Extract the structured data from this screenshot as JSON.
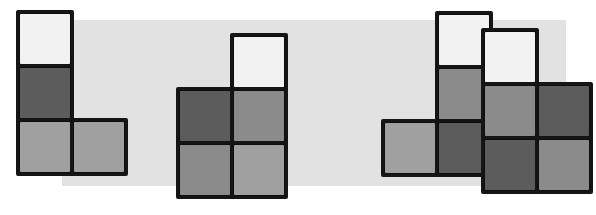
{
  "scene": {
    "width": 596,
    "height": 215,
    "background_color": "#ffffff",
    "title": "Four grayscale block shapes on a light gray band",
    "band": {
      "name": "background-band",
      "x": 62,
      "y": 20,
      "width": 504,
      "height": 166,
      "color": "#e2e2e2"
    },
    "palette": {
      "white": "#f2f2f2",
      "light_gray": "#a0a0a0",
      "mid_gray": "#8b8b8b",
      "dark_gray": "#5c5c5c",
      "outline": "#151515"
    },
    "cell_size": 54,
    "shapes": [
      {
        "name": "shape-1",
        "label": "J-tetromino",
        "origin_x": 16,
        "origin_y": 10,
        "cells": [
          {
            "name": "cell-r0c0",
            "col": 0,
            "row": 0,
            "color": "#f2f2f2",
            "shade": "white"
          },
          {
            "name": "cell-r1c0",
            "col": 0,
            "row": 1,
            "color": "#5c5c5c",
            "shade": "dark_gray"
          },
          {
            "name": "cell-r2c0",
            "col": 0,
            "row": 2,
            "color": "#a0a0a0",
            "shade": "light_gray"
          },
          {
            "name": "cell-r2c1",
            "col": 1,
            "row": 2,
            "color": "#a0a0a0",
            "shade": "light_gray"
          }
        ]
      },
      {
        "name": "shape-2",
        "label": "P-pentomino",
        "origin_x": 176,
        "origin_y": 33,
        "cells": [
          {
            "name": "cell-r0c1",
            "col": 1,
            "row": 0,
            "color": "#f2f2f2",
            "shade": "white"
          },
          {
            "name": "cell-r1c0",
            "col": 0,
            "row": 1,
            "color": "#5c5c5c",
            "shade": "dark_gray"
          },
          {
            "name": "cell-r1c1",
            "col": 1,
            "row": 1,
            "color": "#8b8b8b",
            "shade": "mid_gray"
          },
          {
            "name": "cell-r2c0",
            "col": 0,
            "row": 2,
            "color": "#8b8b8b",
            "shade": "mid_gray"
          },
          {
            "name": "cell-r2c1",
            "col": 1,
            "row": 2,
            "color": "#a0a0a0",
            "shade": "light_gray"
          }
        ]
      },
      {
        "name": "shape-3",
        "label": "L-tetromino",
        "origin_x": 381,
        "origin_y": 11,
        "cells": [
          {
            "name": "cell-r0c1",
            "col": 1,
            "row": 0,
            "color": "#f2f2f2",
            "shade": "white"
          },
          {
            "name": "cell-r1c1",
            "col": 1,
            "row": 1,
            "color": "#8b8b8b",
            "shade": "mid_gray"
          },
          {
            "name": "cell-r2c0",
            "col": 0,
            "row": 2,
            "color": "#a0a0a0",
            "shade": "light_gray"
          },
          {
            "name": "cell-r2c1",
            "col": 1,
            "row": 2,
            "color": "#5c5c5c",
            "shade": "dark_gray"
          }
        ]
      },
      {
        "name": "shape-4",
        "label": "P-pentomino",
        "origin_x": 481,
        "origin_y": 28,
        "cells": [
          {
            "name": "cell-r0c0",
            "col": 0,
            "row": 0,
            "color": "#f2f2f2",
            "shade": "white"
          },
          {
            "name": "cell-r1c0",
            "col": 0,
            "row": 1,
            "color": "#8b8b8b",
            "shade": "mid_gray"
          },
          {
            "name": "cell-r1c1",
            "col": 1,
            "row": 1,
            "color": "#5c5c5c",
            "shade": "dark_gray"
          },
          {
            "name": "cell-r2c0",
            "col": 0,
            "row": 2,
            "color": "#5c5c5c",
            "shade": "dark_gray"
          },
          {
            "name": "cell-r2c1",
            "col": 1,
            "row": 2,
            "color": "#8b8b8b",
            "shade": "mid_gray"
          }
        ]
      }
    ]
  }
}
